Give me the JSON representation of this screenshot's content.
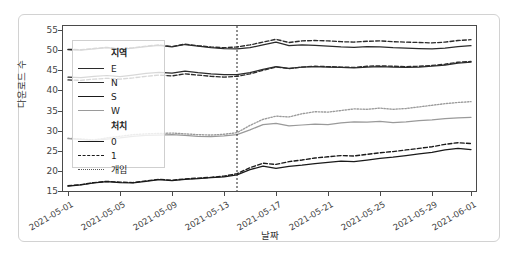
{
  "chart_data": {
    "type": "line",
    "title": "",
    "xlabel": "날짜",
    "ylabel": "다운로드 수",
    "ylim": [
      15,
      56
    ],
    "yticks": [
      15,
      20,
      25,
      30,
      35,
      40,
      45,
      50,
      55
    ],
    "grid": false,
    "legend_position": "upper-left-inside",
    "x_tick_labels": [
      "2021-05-01",
      "2021-05-05",
      "2021-05-09",
      "2021-05-13",
      "2021-05-17",
      "2021-05-21",
      "2021-05-25",
      "2021-05-29",
      "2021-06-01"
    ],
    "x_tick_values": [
      "2021-05-01",
      "2021-05-05",
      "2021-05-09",
      "2021-05-13",
      "2021-05-17",
      "2021-05-21",
      "2021-05-25",
      "2021-05-29",
      "2021-06-01"
    ],
    "x": [
      "2021-05-01",
      "2021-05-02",
      "2021-05-03",
      "2021-05-04",
      "2021-05-05",
      "2021-05-06",
      "2021-05-07",
      "2021-05-08",
      "2021-05-09",
      "2021-05-10",
      "2021-05-11",
      "2021-05-12",
      "2021-05-13",
      "2021-05-14",
      "2021-05-15",
      "2021-05-16",
      "2021-05-17",
      "2021-05-18",
      "2021-05-19",
      "2021-05-20",
      "2021-05-21",
      "2021-05-22",
      "2021-05-23",
      "2021-05-24",
      "2021-05-25",
      "2021-05-26",
      "2021-05-27",
      "2021-05-28",
      "2021-05-29",
      "2021-05-30",
      "2021-05-31",
      "2021-06-01"
    ],
    "annotations": [
      {
        "type": "vline",
        "x": "2021-05-14",
        "label": "개입",
        "style": "dotted",
        "color": "#222222"
      }
    ],
    "series": [
      {
        "name": "E / 0",
        "region": "E",
        "treatment": "0",
        "style": "solid",
        "color": "#2b2b2b",
        "values": [
          50.1,
          50.0,
          50.3,
          50.6,
          50.2,
          50.5,
          50.9,
          51.2,
          50.8,
          51.4,
          51.0,
          50.6,
          50.4,
          50.3,
          50.6,
          51.3,
          52.0,
          51.1,
          51.3,
          51.2,
          51.0,
          50.8,
          50.7,
          50.9,
          50.8,
          50.6,
          50.5,
          50.4,
          50.3,
          50.5,
          50.9,
          51.1
        ]
      },
      {
        "name": "E / 1",
        "region": "E",
        "treatment": "1",
        "style": "dashed",
        "color": "#2b2b2b",
        "values": [
          50.2,
          50.1,
          50.4,
          50.7,
          50.3,
          50.6,
          51.0,
          51.3,
          50.9,
          51.5,
          51.1,
          50.8,
          50.6,
          50.8,
          51.3,
          52.0,
          52.7,
          51.9,
          52.3,
          52.4,
          52.3,
          52.1,
          52.0,
          52.2,
          52.3,
          52.1,
          52.0,
          51.9,
          51.8,
          52.0,
          52.4,
          52.6
        ]
      },
      {
        "name": "N / 0",
        "region": "N",
        "treatment": "0",
        "style": "solid",
        "color": "#2b2b2b",
        "values": [
          43.3,
          43.2,
          43.5,
          43.7,
          43.4,
          43.8,
          44.2,
          44.5,
          44.3,
          44.8,
          44.4,
          44.1,
          43.9,
          43.9,
          44.4,
          45.2,
          45.9,
          45.5,
          45.8,
          45.9,
          45.8,
          45.7,
          45.6,
          45.8,
          45.9,
          45.8,
          45.7,
          45.8,
          46.0,
          46.3,
          46.8,
          47.0
        ]
      },
      {
        "name": "N / 1",
        "region": "N",
        "treatment": "1",
        "style": "dashed",
        "color": "#2b2b2b",
        "values": [
          42.6,
          42.5,
          42.8,
          43.0,
          42.8,
          43.1,
          43.5,
          43.8,
          43.6,
          44.1,
          43.8,
          43.5,
          43.3,
          43.5,
          44.1,
          45.0,
          45.8,
          45.4,
          45.8,
          46.0,
          45.9,
          45.8,
          45.7,
          46.0,
          46.1,
          46.0,
          45.9,
          46.0,
          46.2,
          46.5,
          47.0,
          47.2
        ]
      },
      {
        "name": "W / 0",
        "region": "W",
        "treatment": "0",
        "style": "solid",
        "color": "#9a9a9a",
        "values": [
          28.0,
          27.8,
          27.5,
          27.9,
          28.2,
          28.6,
          28.8,
          28.9,
          29.0,
          28.8,
          28.6,
          28.5,
          28.7,
          29.0,
          30.2,
          31.5,
          31.8,
          31.2,
          31.4,
          31.6,
          31.5,
          31.9,
          32.2,
          32.1,
          32.3,
          32.0,
          32.2,
          32.5,
          32.7,
          33.0,
          33.2,
          33.3
        ]
      },
      {
        "name": "W / 1",
        "region": "W",
        "treatment": "1",
        "style": "dotted",
        "color": "#9a9a9a",
        "values": [
          28.1,
          27.9,
          27.7,
          28.2,
          28.6,
          29.0,
          29.2,
          29.3,
          29.4,
          29.2,
          29.0,
          28.9,
          29.1,
          29.5,
          31.3,
          32.8,
          33.6,
          33.4,
          34.2,
          34.7,
          34.6,
          35.0,
          35.4,
          35.3,
          35.6,
          35.3,
          35.5,
          35.9,
          36.3,
          36.7,
          37.0,
          37.2
        ]
      },
      {
        "name": "S / 0",
        "region": "S",
        "treatment": "0",
        "style": "solid",
        "color": "#1a1a1a",
        "values": [
          16.2,
          16.5,
          17.0,
          17.3,
          17.1,
          17.0,
          17.4,
          17.8,
          17.6,
          17.9,
          18.1,
          18.3,
          18.5,
          19.0,
          20.3,
          21.2,
          20.6,
          21.1,
          21.4,
          21.8,
          22.1,
          22.4,
          22.3,
          22.7,
          23.1,
          23.4,
          23.8,
          24.2,
          24.6,
          25.2,
          25.6,
          25.3
        ]
      },
      {
        "name": "S / 1",
        "region": "S",
        "treatment": "1",
        "style": "dashed",
        "color": "#1a1a1a",
        "values": [
          16.3,
          16.6,
          17.1,
          17.4,
          17.2,
          17.1,
          17.5,
          17.9,
          17.7,
          18.0,
          18.2,
          18.4,
          18.7,
          19.3,
          20.8,
          21.9,
          21.6,
          22.3,
          22.7,
          23.2,
          23.5,
          23.8,
          23.7,
          24.1,
          24.5,
          24.8,
          25.2,
          25.6,
          26.0,
          26.6,
          27.0,
          26.8
        ]
      }
    ]
  },
  "legend": {
    "groups": [
      {
        "title": "지역",
        "name": "region",
        "items": [
          {
            "label": "E",
            "style": "solid",
            "color": "#2b2b2b"
          },
          {
            "label": "N",
            "style": "solid",
            "color": "#2b2b2b"
          },
          {
            "label": "S",
            "style": "solid",
            "color": "#1a1a1a"
          },
          {
            "label": "W",
            "style": "solid",
            "color": "#9a9a9a"
          }
        ]
      },
      {
        "title": "처치",
        "name": "treatment",
        "items": [
          {
            "label": "0",
            "style": "solid",
            "color": "#1a1a1a"
          },
          {
            "label": "1",
            "style": "dashed",
            "color": "#1a1a1a"
          },
          {
            "label": "개입",
            "style": "dotted",
            "color": "#555555"
          }
        ]
      }
    ]
  },
  "colors": {
    "frame": "#4a4a4a",
    "card_border": "#d2d2d2",
    "background": "#ffffff",
    "dark_line": "#2b2b2b",
    "gray_line": "#9a9a9a",
    "vline": "#222222"
  }
}
